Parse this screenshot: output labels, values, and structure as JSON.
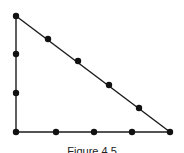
{
  "diagram": {
    "line_color": "#1a1a1a",
    "dot_color": "#111111",
    "vertices": {
      "top": [
        16,
        16
      ],
      "bottom_left": [
        16,
        132
      ],
      "bottom_right": [
        170,
        132
      ]
    },
    "dots": [
      {
        "edge": "left",
        "x": 16,
        "y": 16
      },
      {
        "edge": "left",
        "x": 16,
        "y": 54
      },
      {
        "edge": "left",
        "x": 16,
        "y": 93
      },
      {
        "edge": "left",
        "x": 16,
        "y": 132
      },
      {
        "edge": "bottom",
        "x": 56,
        "y": 132
      },
      {
        "edge": "bottom",
        "x": 94,
        "y": 132
      },
      {
        "edge": "bottom",
        "x": 132,
        "y": 132
      },
      {
        "edge": "bottom",
        "x": 170,
        "y": 132
      },
      {
        "edge": "hypotenuse",
        "x": 48,
        "y": 39
      },
      {
        "edge": "hypotenuse",
        "x": 78,
        "y": 61
      },
      {
        "edge": "hypotenuse",
        "x": 109,
        "y": 85
      },
      {
        "edge": "hypotenuse",
        "x": 139,
        "y": 108
      }
    ],
    "dot_counts": {
      "left_edge": 4,
      "bottom_edge": 5,
      "hypotenuse": 6
    },
    "caption": "Figure 4.5",
    "caption_note": "Cropped at the bottom edge; only partially visible"
  }
}
